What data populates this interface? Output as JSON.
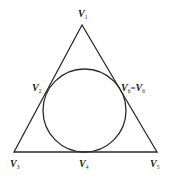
{
  "diagram": {
    "colors": {
      "stroke": "#2a2a2a",
      "text": "#1a1a1a",
      "background": "#ffffff"
    },
    "triangle": {
      "vertices": [
        {
          "name": "apex",
          "x": 82,
          "y": 25
        },
        {
          "name": "bottom-left",
          "x": 14,
          "y": 152
        },
        {
          "name": "bottom-right",
          "x": 157,
          "y": 152
        }
      ]
    },
    "circle": {
      "cx": 84.5,
      "cy": 110.5,
      "r": 41.5
    },
    "labels": [
      {
        "id": "v1",
        "letter": "V",
        "sub": "1",
        "x": 78,
        "y": 17
      },
      {
        "id": "v2",
        "letter": "V",
        "sub": "2",
        "x": 32,
        "y": 91
      },
      {
        "id": "v6v6",
        "letter": "V",
        "sub": "6",
        "eq": "=",
        "letter2": "V",
        "sub2": "6",
        "x": 121,
        "y": 91
      },
      {
        "id": "v3",
        "letter": "V",
        "sub": "3",
        "x": 10,
        "y": 167
      },
      {
        "id": "v4",
        "letter": "V",
        "sub": "4",
        "x": 79,
        "y": 167
      },
      {
        "id": "v5",
        "letter": "V",
        "sub": "5",
        "x": 150,
        "y": 167
      }
    ]
  }
}
